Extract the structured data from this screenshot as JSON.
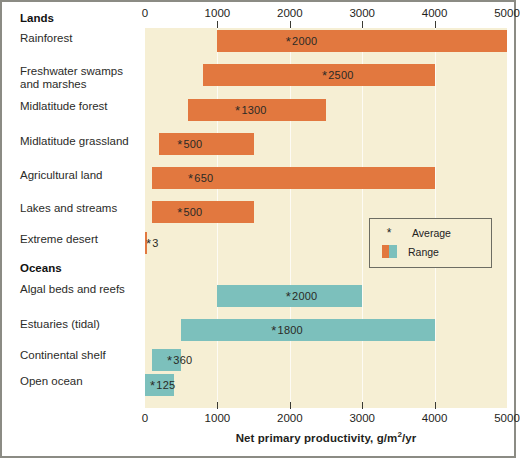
{
  "chart_data": {
    "type": "bar",
    "title": "",
    "xlabel": "Net primary productivity, g/m2/yr",
    "xlabel_parts": {
      "pre": "Net primary productivity, g/m",
      "sup": "2",
      "post": "/yr"
    },
    "ylabel": "",
    "xlim": [
      0,
      5000
    ],
    "xticks": [
      0,
      1000,
      2000,
      3000,
      4000,
      5000
    ],
    "xticklabels": [
      "0",
      "1000",
      "2000",
      "3000",
      "4000",
      "5000"
    ],
    "axis_positions": [
      "top",
      "bottom"
    ],
    "grid": true,
    "orientation": "horizontal",
    "legend": {
      "position": "inside-right",
      "entries": [
        {
          "label": "Average",
          "marker": "*"
        },
        {
          "label": "Range",
          "marker": "swatch"
        }
      ]
    },
    "groups": [
      {
        "name": "Lands",
        "color": "#e2783f",
        "items": [
          {
            "label": "Rainforest",
            "label_line2": "",
            "range": [
              1000,
              5000
            ],
            "average": 2000,
            "average_text": "2000"
          },
          {
            "label": "Freshwater swamps",
            "label_line2": "and marshes",
            "range": [
              800,
              4000
            ],
            "average": 2500,
            "average_text": "2500"
          },
          {
            "label": "Midlatitude forest",
            "label_line2": "",
            "range": [
              600,
              2500
            ],
            "average": 1300,
            "average_text": "1300"
          },
          {
            "label": "Midlatitude grassland",
            "label_line2": "",
            "range": [
              200,
              1500
            ],
            "average": 500,
            "average_text": "500"
          },
          {
            "label": "Agricultural land",
            "label_line2": "",
            "range": [
              100,
              4000
            ],
            "average": 650,
            "average_text": "650"
          },
          {
            "label": "Lakes and streams",
            "label_line2": "",
            "range": [
              100,
              1500
            ],
            "average": 500,
            "average_text": "500"
          },
          {
            "label": "Extreme desert",
            "label_line2": "",
            "range": [
              0,
              10
            ],
            "average": 3,
            "average_text": "3"
          }
        ]
      },
      {
        "name": "Oceans",
        "color": "#7cc0bc",
        "items": [
          {
            "label": "Algal beds and reefs",
            "label_line2": "",
            "range": [
              1000,
              3000
            ],
            "average": 2000,
            "average_text": "2000"
          },
          {
            "label": "Estuaries (tidal)",
            "label_line2": "",
            "range": [
              500,
              4000
            ],
            "average": 1800,
            "average_text": "1800"
          },
          {
            "label": "Continental shelf",
            "label_line2": "",
            "range": [
              100,
              500
            ],
            "average": 360,
            "average_text": "360"
          },
          {
            "label": "Open ocean",
            "label_line2": "",
            "range": [
              0,
              400
            ],
            "average": 125,
            "average_text": "125"
          }
        ]
      }
    ]
  },
  "colors": {
    "land_bar": "#e2783f",
    "ocean_bar": "#7cc0bc",
    "panel_background": "#f6efd4",
    "frame": "#8b8b84",
    "text": "#2b2b28"
  }
}
